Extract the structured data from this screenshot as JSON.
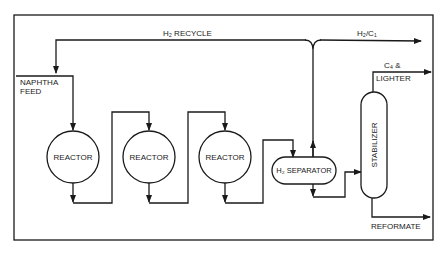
{
  "diagram": {
    "type": "process-flow",
    "line_color": "#1a1a1a",
    "background": "#ffffff",
    "units": [
      {
        "id": "reactor-1",
        "label": "REACTOR",
        "shape": "circle"
      },
      {
        "id": "reactor-2",
        "label": "REACTOR",
        "shape": "circle"
      },
      {
        "id": "reactor-3",
        "label": "REACTOR",
        "shape": "circle"
      },
      {
        "id": "h2-separator",
        "label": "H₂ SEPARATOR",
        "shape": "horizontal-drum"
      },
      {
        "id": "stabilizer",
        "label": "STABILIZER",
        "shape": "vertical-column"
      }
    ],
    "streams": {
      "h2_recycle": "H₂ RECYCLE",
      "naphtha_feed_line1": "NAPHTHA",
      "naphtha_feed_line2": "FEED",
      "h2_c1": "H₂/C₁",
      "c4_lighter_line1": "C₄ &",
      "c4_lighter_line2": "LIGHTER",
      "reformate": "REFORMATE"
    },
    "flow": [
      "NAPHTHA FEED + H₂ RECYCLE → REACTOR 1",
      "REACTOR 1 → REACTOR 2",
      "REACTOR 2 → REACTOR 3",
      "REACTOR 3 → H₂ SEPARATOR",
      "H₂ SEPARATOR (top) → H₂ RECYCLE / H₂/C₁",
      "H₂ SEPARATOR (bottom) → STABILIZER",
      "STABILIZER (top) → C₄ & LIGHTER",
      "STABILIZER (bottom) → REFORMATE"
    ]
  }
}
